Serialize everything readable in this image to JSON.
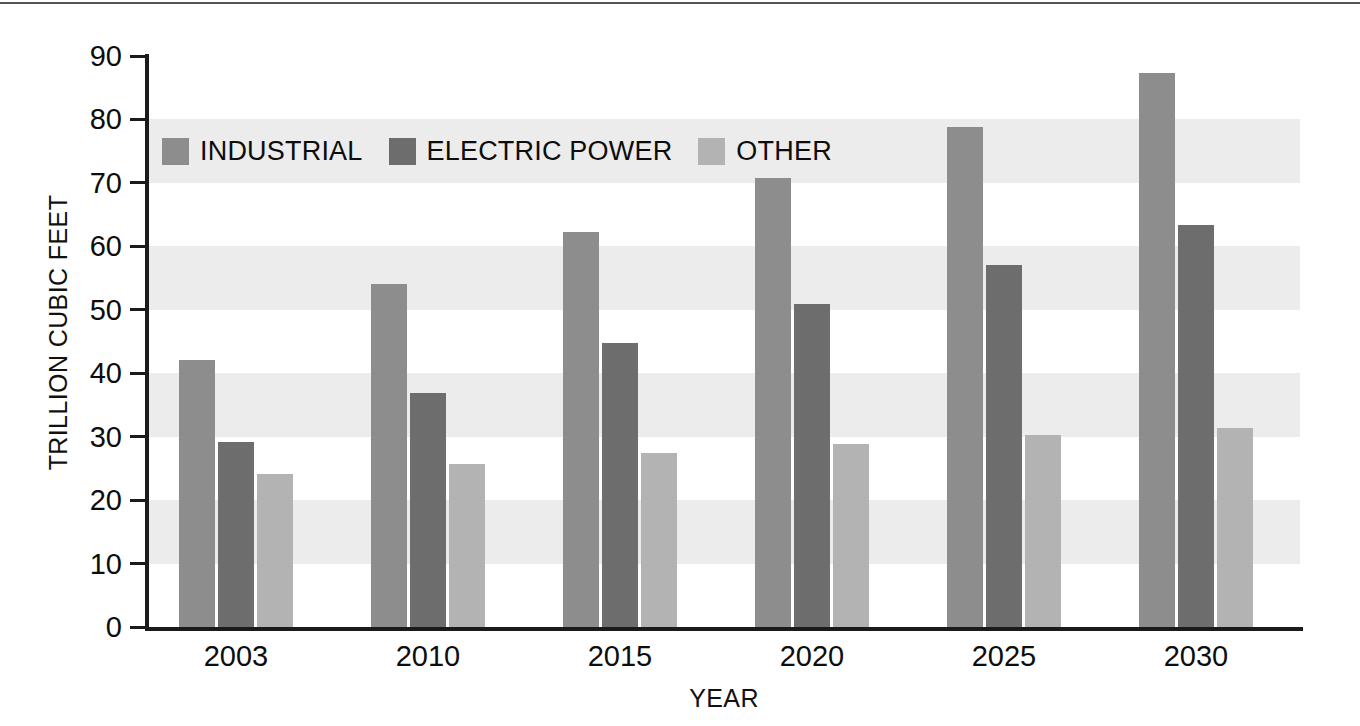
{
  "chart_data": {
    "type": "bar",
    "title": "",
    "subtitle": "",
    "xlabel": "YEAR",
    "ylabel": "TRILLION CUBIC FEET",
    "categories": [
      "2003",
      "2010",
      "2015",
      "2020",
      "2025",
      "2030"
    ],
    "series": [
      {
        "name": "INDUSTRIAL",
        "color": "#8d8d8d",
        "values": [
          42.1,
          54.1,
          62.3,
          70.8,
          78.8,
          87.4
        ]
      },
      {
        "name": "ELECTRIC POWER",
        "color": "#6d6d6d",
        "values": [
          29.2,
          36.9,
          44.8,
          50.9,
          57.1,
          63.3
        ]
      },
      {
        "name": "OTHER",
        "color": "#b3b3b3",
        "values": [
          24.1,
          25.7,
          27.4,
          28.8,
          30.2,
          31.4
        ]
      }
    ],
    "ylim": [
      0,
      90
    ],
    "ytick_labels": [
      "0",
      "10",
      "20",
      "30",
      "40",
      "50",
      "60",
      "70",
      "80",
      "90"
    ],
    "ytick_values": [
      0,
      10,
      20,
      30,
      40,
      50,
      60,
      70,
      80,
      90
    ],
    "grid": false,
    "banded_background": true,
    "band_color": "#ececec",
    "band_interval": 10,
    "legend_position": "upper-left-inside",
    "legend_entries": [
      "INDUSTRIAL",
      "ELECTRIC POWER",
      "OTHER"
    ]
  }
}
